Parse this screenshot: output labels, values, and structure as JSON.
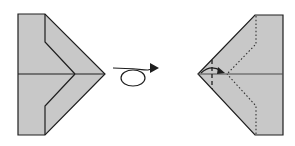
{
  "diagram": {
    "title": "Paper airplane folding step: turn the model over",
    "colors": {
      "paper": "#c8c8c8",
      "outline": "#1e1e1e",
      "background": "#ffffff"
    },
    "steps": [
      {
        "id": "before",
        "label": "Folded model, front side"
      },
      {
        "id": "turn-over",
        "label": "Turn over"
      },
      {
        "id": "after",
        "label": "Folded model, back side with fold guides"
      }
    ],
    "annotations": {
      "turn_symbol": "turn-over-loop-arrow-icon",
      "fold_arrow": "fold-arrow-icon",
      "valley_fold_line": "dashed",
      "hidden_edges": "dotted"
    }
  }
}
